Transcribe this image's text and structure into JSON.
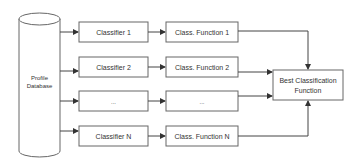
{
  "diagram": {
    "database": {
      "label_line1": "Profile",
      "label_line2": "Database"
    },
    "classifiers": [
      {
        "label": "Classifier 1"
      },
      {
        "label": "Classifier 2"
      },
      {
        "label": "..."
      },
      {
        "label": "Classifier N"
      }
    ],
    "functions": [
      {
        "label": "Class. Function 1"
      },
      {
        "label": "Class. Function 2"
      },
      {
        "label": "..."
      },
      {
        "label": "Class. Function N"
      }
    ],
    "best": {
      "label_line1": "Best Classification",
      "label_line2": "Function"
    },
    "colors": {
      "stroke": "#555555",
      "text": "#333333",
      "background": "#ffffff"
    }
  }
}
